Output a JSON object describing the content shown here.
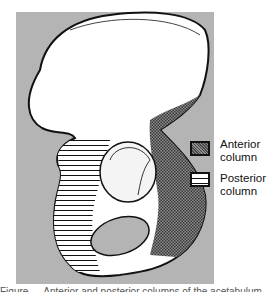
{
  "figure": {
    "background_color": "#b4b4b4",
    "bone_fill": "#ffffff",
    "outline_color": "#111111"
  },
  "legend": {
    "items": [
      {
        "label_line1": "Anterior",
        "label_line2": "column",
        "pattern": "stippled-crosshatch",
        "color": "#7a7a7a"
      },
      {
        "label_line1": "Posterior",
        "label_line2": "column",
        "pattern": "horizontal-lines",
        "color": "#ffffff"
      }
    ]
  },
  "caption": {
    "text": "Figure  —  Anterior and posterior columns of the acetabulum"
  }
}
